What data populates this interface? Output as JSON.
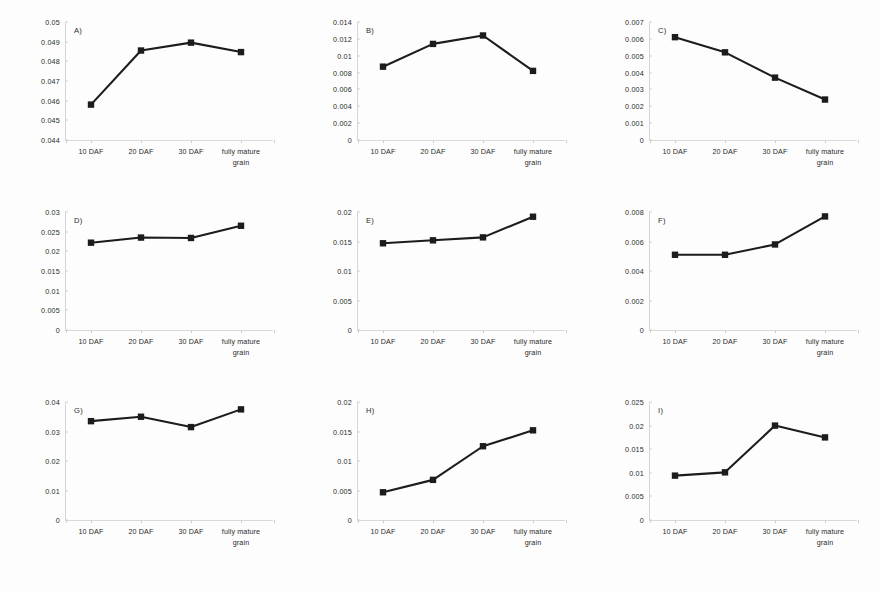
{
  "figure": {
    "background": "#fdfdfd",
    "line_color": "#1c1c1c",
    "axis_color": "#d6d6d6",
    "categories": [
      "10 DAF",
      "20 DAF",
      "30 DAF",
      "fully mature grain"
    ],
    "category_lines": [
      [
        "10 DAF",
        ""
      ],
      [
        "20 DAF",
        ""
      ],
      [
        "30 DAF",
        ""
      ],
      [
        "fully mature",
        "grain"
      ]
    ]
  },
  "chart_data": [
    {
      "type": "line",
      "title": "A)",
      "panel": "A",
      "categories": [
        "10 DAF",
        "20 DAF",
        "30 DAF",
        "fully mature grain"
      ],
      "values": [
        0.0458,
        0.04855,
        0.04895,
        0.04847
      ],
      "ylim": [
        0.044,
        0.05
      ],
      "yticks": [
        0.044,
        0.045,
        0.046,
        0.047,
        0.048,
        0.049,
        0.05
      ],
      "ytick_labels": [
        "0.044",
        "0.045",
        "0.046",
        "0.047",
        "0.048",
        "0.049",
        "0.05"
      ],
      "xlabel": "",
      "ylabel": "",
      "grid": false,
      "legend": false
    },
    {
      "type": "line",
      "title": "B)",
      "panel": "B",
      "categories": [
        "10 DAF",
        "20 DAF",
        "30 DAF",
        "fully mature grain"
      ],
      "values": [
        0.0087,
        0.0114,
        0.0124,
        0.0082
      ],
      "ylim": [
        0,
        0.014
      ],
      "yticks": [
        0,
        0.002,
        0.004,
        0.006,
        0.008,
        0.01,
        0.012,
        0.014
      ],
      "ytick_labels": [
        "0",
        "0.002",
        "0.004",
        "0.006",
        "0.008",
        "0.01",
        "0.012",
        "0.014"
      ],
      "xlabel": "",
      "ylabel": "",
      "grid": false,
      "legend": false
    },
    {
      "type": "line",
      "title": "C)",
      "panel": "C",
      "categories": [
        "10 DAF",
        "20 DAF",
        "30 DAF",
        "fully mature grain"
      ],
      "values": [
        0.0061,
        0.0052,
        0.0037,
        0.0024
      ],
      "ylim": [
        0,
        0.007
      ],
      "yticks": [
        0,
        0.001,
        0.002,
        0.003,
        0.004,
        0.005,
        0.006,
        0.007
      ],
      "ytick_labels": [
        "0",
        "0.001",
        "0.002",
        "0.003",
        "0.004",
        "0.005",
        "0.006",
        "0.007"
      ],
      "xlabel": "",
      "ylabel": "",
      "grid": false,
      "legend": false
    },
    {
      "type": "line",
      "title": "D)",
      "panel": "D",
      "categories": [
        "10 DAF",
        "20 DAF",
        "30 DAF",
        "fully mature grain"
      ],
      "values": [
        0.0222,
        0.0235,
        0.0234,
        0.0265
      ],
      "ylim": [
        0,
        0.03
      ],
      "yticks": [
        0,
        0.005,
        0.01,
        0.015,
        0.02,
        0.025,
        0.03
      ],
      "ytick_labels": [
        "0",
        "0.005",
        "0.01",
        "0.015",
        "0.02",
        "0.025",
        "0.03"
      ],
      "xlabel": "",
      "ylabel": "",
      "grid": false,
      "legend": false
    },
    {
      "type": "line",
      "title": "E)",
      "panel": "E",
      "categories": [
        "10 DAF",
        "20 DAF",
        "30 DAF",
        "fully mature grain"
      ],
      "values": [
        0.0147,
        0.0152,
        0.0157,
        0.0192
      ],
      "ylim": [
        0,
        0.02
      ],
      "yticks": [
        0,
        0.005,
        0.01,
        0.015,
        0.02
      ],
      "ytick_labels": [
        "0",
        "0.005",
        "0.01",
        "0.015",
        "0.02"
      ],
      "xlabel": "",
      "ylabel": "",
      "grid": false,
      "legend": false
    },
    {
      "type": "line",
      "title": "F)",
      "panel": "F",
      "categories": [
        "10 DAF",
        "20 DAF",
        "30 DAF",
        "fully mature grain"
      ],
      "values": [
        0.0051,
        0.0051,
        0.0058,
        0.0077
      ],
      "ylim": [
        0,
        0.008
      ],
      "yticks": [
        0,
        0.002,
        0.004,
        0.006,
        0.008
      ],
      "ytick_labels": [
        "0",
        "0.002",
        "0.004",
        "0.006",
        "0.008"
      ],
      "xlabel": "",
      "ylabel": "",
      "grid": false,
      "legend": false
    },
    {
      "type": "line",
      "title": "G)",
      "panel": "G",
      "categories": [
        "10 DAF",
        "20 DAF",
        "30 DAF",
        "fully mature grain"
      ],
      "values": [
        0.0335,
        0.035,
        0.0315,
        0.0375
      ],
      "ylim": [
        0,
        0.04
      ],
      "yticks": [
        0,
        0.01,
        0.02,
        0.03,
        0.04
      ],
      "ytick_labels": [
        "0",
        "0.01",
        "0.02",
        "0.03",
        "0.04"
      ],
      "xlabel": "",
      "ylabel": "",
      "grid": false,
      "legend": false
    },
    {
      "type": "line",
      "title": "H)",
      "panel": "H",
      "categories": [
        "10 DAF",
        "20 DAF",
        "30 DAF",
        "fully mature grain"
      ],
      "values": [
        0.0047,
        0.0068,
        0.0125,
        0.0152
      ],
      "ylim": [
        0,
        0.02
      ],
      "yticks": [
        0,
        0.005,
        0.01,
        0.015,
        0.02
      ],
      "ytick_labels": [
        "0",
        "0.005",
        "0.01",
        "0.015",
        "0.02"
      ],
      "xlabel": "",
      "ylabel": "",
      "grid": false,
      "legend": false
    },
    {
      "type": "line",
      "title": "I)",
      "panel": "I",
      "categories": [
        "10 DAF",
        "20 DAF",
        "30 DAF",
        "fully mature grain"
      ],
      "values": [
        0.0094,
        0.0101,
        0.02,
        0.0175
      ],
      "ylim": [
        0,
        0.025
      ],
      "yticks": [
        0,
        0.005,
        0.01,
        0.015,
        0.02,
        0.025
      ],
      "ytick_labels": [
        "0",
        "0.005",
        "0.01",
        "0.015",
        "0.02",
        "0.025"
      ],
      "xlabel": "",
      "ylabel": "",
      "grid": false,
      "legend": false
    }
  ]
}
